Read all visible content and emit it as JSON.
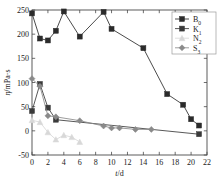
{
  "chart_data": {
    "type": "line",
    "title": "",
    "subtitle": "",
    "xlabel": "t/d",
    "ylabel": "η/mPa·s",
    "xlim": [
      0,
      22
    ],
    "ylim": [
      -50,
      250
    ],
    "xticks": [
      0,
      2,
      4,
      6,
      8,
      10,
      12,
      14,
      16,
      18,
      20,
      22
    ],
    "yticks": [
      -50,
      0,
      50,
      100,
      150,
      200,
      250
    ],
    "xtick_labels": [
      "0",
      "2",
      "4",
      "6",
      "8",
      "10",
      "12",
      "14",
      "16",
      "18",
      "20",
      "22"
    ],
    "ytick_labels": [
      "-50",
      "0",
      "50",
      "100",
      "150",
      "200",
      "250"
    ],
    "grid": false,
    "legend_position": "top-right",
    "series": [
      {
        "name": "B0",
        "label_base": "B",
        "label_sub": "0",
        "color": "#2b2b2b",
        "marker": "square",
        "x": [
          0,
          1,
          2,
          3,
          4,
          6,
          9,
          10,
          14,
          17,
          19,
          20,
          21
        ],
        "y": [
          243,
          191,
          187,
          207,
          247,
          195,
          246,
          211,
          171,
          76,
          54,
          24,
          11
        ]
      },
      {
        "name": "K1",
        "label_base": "K",
        "label_sub": "1",
        "color": "#3a3a3a",
        "marker": "square",
        "x": [
          0,
          1,
          2,
          3,
          21
        ],
        "y": [
          41,
          97,
          48,
          23,
          -7
        ]
      },
      {
        "name": "N2",
        "label_base": "N",
        "label_sub": "2",
        "color": "#d8d8d8",
        "marker": "triangle",
        "x": [
          0,
          1,
          2,
          3,
          4,
          5,
          6
        ],
        "y": [
          22,
          18,
          -3,
          -18,
          -9,
          -13,
          -23
        ]
      },
      {
        "name": "S3",
        "label_base": "S",
        "label_sub": "3",
        "color": "#8a8a8a",
        "marker": "diamond",
        "x": [
          0,
          1,
          2,
          3,
          6,
          9,
          10,
          11,
          13,
          15
        ],
        "y": [
          108,
          92,
          31,
          29,
          21,
          10,
          6,
          6,
          3,
          3
        ]
      }
    ],
    "legend_entries": [
      {
        "base": "B",
        "sub": "0",
        "color": "#2b2b2b",
        "marker": "square"
      },
      {
        "base": "K",
        "sub": "1",
        "color": "#3a3a3a",
        "marker": "square"
      },
      {
        "base": "N",
        "sub": "2",
        "color": "#d8d8d8",
        "marker": "triangle"
      },
      {
        "base": "S",
        "sub": "3",
        "color": "#8a8a8a",
        "marker": "diamond"
      }
    ]
  }
}
